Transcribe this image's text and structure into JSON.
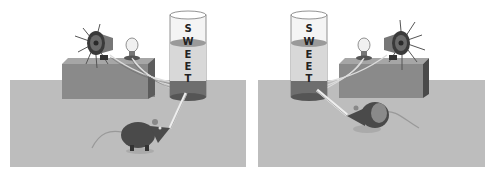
{
  "figure": {
    "panels": [
      {
        "id": "left",
        "tube_label": [
          "S",
          "W",
          "E",
          "E",
          "T"
        ],
        "elements": [
          "speaker-with-rays",
          "light-bulb",
          "box",
          "tube",
          "drinking-straw",
          "rat"
        ]
      },
      {
        "id": "right",
        "tube_label": [
          "S",
          "W",
          "E",
          "E",
          "T"
        ],
        "elements": [
          "tube",
          "light-bulb",
          "speaker-with-rays",
          "box",
          "drinking-straw",
          "rat"
        ]
      }
    ],
    "colors": {
      "floor": "#bdbdbd",
      "box_front": "#8a8a8a",
      "box_top": "#a6a6a6",
      "box_side": "#555555",
      "liquid": "#d8d8d8",
      "tube_base": "#6e6e6e",
      "rat": "#4a4a4a"
    }
  }
}
